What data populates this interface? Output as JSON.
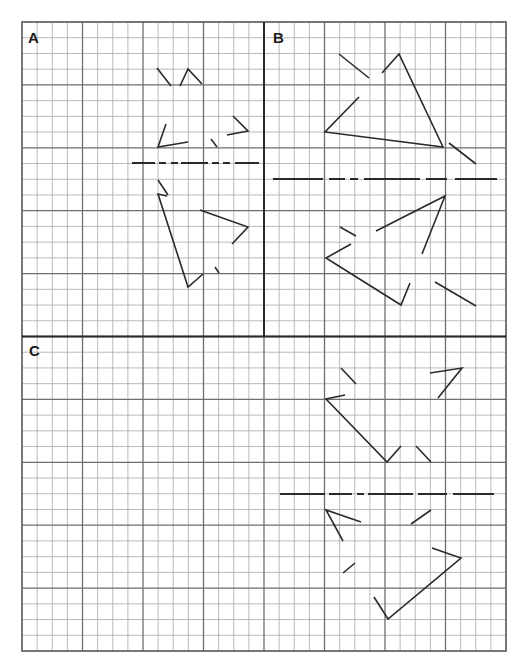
{
  "figure": {
    "grid": {
      "left": 22,
      "top": 22,
      "cols": 32,
      "rows": 40,
      "cell_w": 15.125,
      "cell_h": 15.725,
      "major_every": 4,
      "minor_color": "#a8a8a8",
      "major_color": "#6e6e6e",
      "border_color": "#555555",
      "vertical_divider_col": 16,
      "vertical_divider_rows": [
        0,
        20
      ],
      "horizontal_divider_row": 20
    },
    "stroke_color": "#2a2a2a",
    "panels": [
      {
        "label": "A",
        "label_pos": [
          28,
          43
        ],
        "axis": {
          "y": 163,
          "segments": [
            [
              132,
              155
            ],
            [
              159,
              166
            ],
            [
              171,
              178
            ],
            [
              181,
              208
            ],
            [
              212,
              219
            ],
            [
              223,
              230
            ],
            [
              235,
              259
            ]
          ]
        },
        "polylines": [
          [
            [
              157,
              68
            ],
            [
              171,
              86
            ]
          ],
          [
            [
              180,
              86
            ],
            [
              188,
              69
            ],
            [
              202,
              84
            ]
          ],
          [
            [
              166,
              124
            ],
            [
              158,
              147
            ],
            [
              188,
              142
            ]
          ],
          [
            [
              211,
              139
            ],
            [
              217,
              147
            ]
          ],
          [
            [
              233,
              116
            ],
            [
              248,
              131
            ],
            [
              227,
              135
            ]
          ],
          [
            [
              158,
              180
            ],
            [
              168,
              195
            ]
          ],
          [
            [
              167,
              196
            ],
            [
              158,
              194
            ],
            [
              188,
              287
            ],
            [
              203,
              274
            ]
          ],
          [
            [
              200,
              210
            ],
            [
              248,
              227
            ],
            [
              232,
              244
            ]
          ],
          [
            [
              215,
              267
            ],
            [
              219,
              273
            ]
          ]
        ]
      },
      {
        "label": "B",
        "label_pos": [
          273,
          43
        ],
        "axis": {
          "y": 179,
          "segments": [
            [
              273,
              323
            ],
            [
              329,
              345
            ],
            [
              350,
              358
            ],
            [
              364,
              420
            ],
            [
              426,
              447
            ],
            [
              455,
              497
            ]
          ]
        },
        "polylines": [
          [
            [
              339,
              54
            ],
            [
              369,
              78
            ]
          ],
          [
            [
              382,
              73
            ],
            [
              399,
              54
            ],
            [
              443,
              147
            ],
            [
              325,
              132
            ],
            [
              359,
              97
            ]
          ],
          [
            [
              449,
              143
            ],
            [
              476,
              164
            ]
          ],
          [
            [
              340,
              227
            ],
            [
              356,
              236
            ]
          ],
          [
            [
              376,
              231
            ],
            [
              445,
              196
            ],
            [
              422,
              254
            ]
          ],
          [
            [
              351,
              244
            ],
            [
              326,
              258
            ],
            [
              401,
              305
            ],
            [
              410,
              283
            ]
          ],
          [
            [
              435,
              282
            ],
            [
              476,
              306
            ]
          ]
        ]
      },
      {
        "label": "C",
        "label_pos": [
          29,
          356
        ],
        "axis": {
          "y": 494,
          "segments": [
            [
              280,
              325
            ],
            [
              329,
              352
            ],
            [
              357,
              364
            ],
            [
              368,
              413
            ],
            [
              418,
              447
            ],
            [
              453,
              494
            ]
          ]
        },
        "polylines": [
          [
            [
              341,
              368
            ],
            [
              356,
              384
            ]
          ],
          [
            [
              345,
              395
            ],
            [
              326,
              399
            ],
            [
              387,
              462
            ],
            [
              401,
              446
            ]
          ],
          [
            [
              416,
              446
            ],
            [
              431,
              462
            ]
          ],
          [
            [
              430,
              373
            ],
            [
              462,
              368
            ],
            [
              438,
              398
            ]
          ],
          [
            [
              361,
              522
            ],
            [
              326,
              510
            ],
            [
              343,
              541
            ]
          ],
          [
            [
              411,
              524
            ],
            [
              431,
              510
            ]
          ],
          [
            [
              343,
              573
            ],
            [
              355,
              563
            ]
          ],
          [
            [
              432,
              548
            ],
            [
              461,
              558
            ],
            [
              388,
              619
            ],
            [
              374,
              597
            ]
          ]
        ]
      }
    ]
  }
}
